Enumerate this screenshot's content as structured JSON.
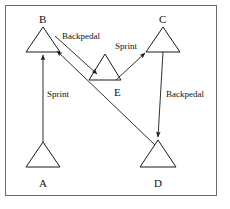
{
  "figure": {
    "title": "",
    "border_color": "#6b6b6b",
    "stroke_color": "#1a1a1a",
    "background": "#ffffff"
  },
  "nodes": [
    {
      "id": "A",
      "label": "A",
      "apex_x": 43,
      "apex_y": 142,
      "base_y": 167,
      "half_width": 17,
      "label_x": 39,
      "label_y": 178
    },
    {
      "id": "B",
      "label": "B",
      "apex_x": 43,
      "apex_y": 27,
      "base_y": 52,
      "half_width": 17,
      "label_x": 39,
      "label_y": 14
    },
    {
      "id": "C",
      "label": "C",
      "apex_x": 163,
      "apex_y": 27,
      "base_y": 52,
      "half_width": 17,
      "label_x": 159,
      "label_y": 14
    },
    {
      "id": "D",
      "label": "D",
      "apex_x": 158,
      "apex_y": 140,
      "base_y": 167,
      "half_width": 18,
      "label_x": 154,
      "label_y": 178
    },
    {
      "id": "E",
      "label": "E",
      "apex_x": 105,
      "apex_y": 54,
      "base_y": 80,
      "half_width": 16,
      "label_x": 114,
      "label_y": 87
    }
  ],
  "edges": [
    {
      "id": "a-to-b",
      "from": "A",
      "to": "B",
      "label": "Sprint",
      "label_x": 47,
      "label_y": 90,
      "points": "43,142 43,55",
      "arrow_at": "43,52"
    },
    {
      "id": "b-to-e",
      "from": "B",
      "to": "E",
      "label": "Backpedal",
      "label_x": 62,
      "label_y": 32,
      "points": "55,36 97,74",
      "arrow_at": "97,74"
    },
    {
      "id": "e-to-c",
      "from": "E",
      "to": "C",
      "label": "Sprint",
      "label_x": 115,
      "label_y": 42,
      "points": "116,80 145,53",
      "arrow_at": "145,53"
    },
    {
      "id": "c-to-d",
      "from": "C",
      "to": "D",
      "label": "Backpedal",
      "label_x": 166,
      "label_y": 90,
      "points": "163,52 158,137",
      "arrow_at": "158,137"
    },
    {
      "id": "d-to-b",
      "from": "D",
      "to": "B",
      "label": "",
      "label_x": 0,
      "label_y": 0,
      "points": "155,145 57,51",
      "arrow_at": "57,51"
    }
  ]
}
